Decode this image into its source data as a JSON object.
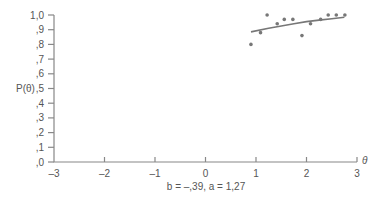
{
  "chart_data": {
    "type": "scatter",
    "title": "",
    "xlabel": "θ",
    "ylabel": "P(θ)",
    "caption": "b = –,39, a = 1,27",
    "xlim": [
      -3,
      3
    ],
    "ylim": [
      0,
      1
    ],
    "x_ticks": [
      "–3",
      "–2",
      "–1",
      "0",
      "1",
      "2",
      "3"
    ],
    "x_tick_values": [
      -3,
      -2,
      -1,
      0,
      1,
      2,
      3
    ],
    "y_ticks": [
      ",0",
      ",1",
      ",2",
      ",3",
      ",4",
      ",5",
      ",6",
      ",7",
      ",8",
      ",9",
      "1,0"
    ],
    "y_tick_values": [
      0,
      0.1,
      0.2,
      0.3,
      0.4,
      0.5,
      0.6,
      0.7,
      0.8,
      0.9,
      1.0
    ],
    "grid": false,
    "series": [
      {
        "name": "observed proportions",
        "kind": "points",
        "x": [
          0.9,
          1.09,
          1.22,
          1.42,
          1.56,
          1.73,
          1.91,
          2.08,
          2.28,
          2.43,
          2.59,
          2.76
        ],
        "y": [
          0.8,
          0.88,
          1.0,
          0.94,
          0.97,
          0.97,
          0.86,
          0.94,
          0.97,
          1.0,
          1.0,
          1.0
        ]
      },
      {
        "name": "fitted ICC",
        "kind": "line",
        "x": [
          0.9,
          1.25,
          1.5,
          1.75,
          2.0,
          2.25,
          2.5,
          2.75
        ],
        "y": [
          0.885,
          0.91,
          0.925,
          0.94,
          0.955,
          0.965,
          0.975,
          0.985
        ]
      }
    ],
    "parameters": {
      "b": -0.39,
      "a": 1.27
    }
  },
  "labels": {
    "y_axis": "P(θ)",
    "x_axis": "θ",
    "caption": "b = –,39, a = 1,27"
  }
}
